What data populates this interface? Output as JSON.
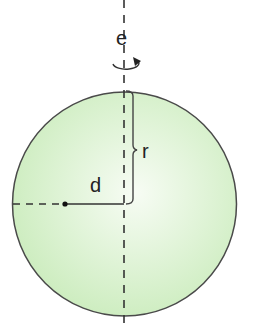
{
  "diagram": {
    "labels": {
      "axis": "e",
      "radius": "r",
      "distance": "d"
    },
    "colors": {
      "sphere_fill_center": "#f6fbf2",
      "sphere_fill_edge": "#cdeec0",
      "stroke": "#333333"
    }
  }
}
